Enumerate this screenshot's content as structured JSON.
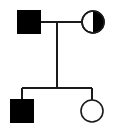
{
  "diagram": {
    "title": "Pedigree chart",
    "type": "pedigree",
    "width": 117,
    "height": 129,
    "background_color": "#ffffff",
    "line_color": "#1a1a1a",
    "fill_affected_color": "#000000",
    "fill_unaffected_color": "#ffffff",
    "line_width": 1.6,
    "symbol_size": 22
  },
  "generations": [
    {
      "id": "generation-1",
      "label": "I",
      "y": 22,
      "individuals": [
        {
          "id": "I-1",
          "shape": "square",
          "sex": "male",
          "status": "affected",
          "fill": "filled",
          "cx": 29,
          "cy": 22,
          "label": ""
        },
        {
          "id": "I-2",
          "shape": "circle",
          "sex": "female",
          "status": "carrier",
          "fill": "half-filled-right",
          "cx": 93,
          "cy": 22,
          "label": ""
        }
      ]
    },
    {
      "id": "generation-2",
      "label": "II",
      "y": 111,
      "individuals": [
        {
          "id": "II-1",
          "shape": "square",
          "sex": "male",
          "status": "affected",
          "fill": "filled",
          "cx": 22,
          "cy": 111,
          "label": ""
        },
        {
          "id": "II-2",
          "shape": "circle",
          "sex": "female",
          "status": "unaffected",
          "fill": "empty",
          "cx": 92,
          "cy": 111,
          "label": ""
        }
      ]
    }
  ],
  "connections": {
    "mating_line": {
      "id": "mating-line-I1-I2",
      "x1": 40,
      "x2": 82,
      "y": 22
    },
    "descent_line": {
      "id": "descent-line",
      "x": 57,
      "y1": 22,
      "y2": 88
    },
    "sibship_line": {
      "id": "sibship-line",
      "x1": 22,
      "x2": 92,
      "y": 88
    },
    "sibling_drops": [
      {
        "id": "sibling-drop-II-1",
        "x": 22,
        "y1": 88,
        "y2": 100
      },
      {
        "id": "sibling-drop-II-2",
        "x": 92,
        "y1": 88,
        "y2": 100
      }
    ]
  }
}
